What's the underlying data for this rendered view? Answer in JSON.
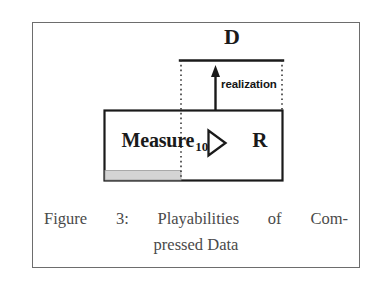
{
  "figure": {
    "diagram": {
      "box_expression": {
        "process_name": "Measure",
        "subscript": "10",
        "operator_glyph": "▷",
        "operator_name": "refinement-triangle",
        "right_operand": "R"
      },
      "bracket_label": "D",
      "arrow_label": "realization",
      "arrow_direction": "up",
      "gray_bar_label": "",
      "colors": {
        "frame": "#6d6d6d",
        "box_stroke": "#1a1a1a",
        "box_fill": "#ffffff",
        "gray_bar_fill": "#d4d4d4",
        "gray_bar_stroke": "#9a9a9a",
        "dotted_line": "#2b2b2b",
        "text": "#1a1a1a",
        "caption_text": "#4a4a4a"
      }
    },
    "caption": {
      "line1_words": [
        "Figure",
        "3:",
        "Playabilities",
        "of",
        "Com-"
      ],
      "line2": "pressed Data",
      "full_text": "Figure 3: Playabilities of Compressed Data",
      "figure_number": "3"
    }
  }
}
